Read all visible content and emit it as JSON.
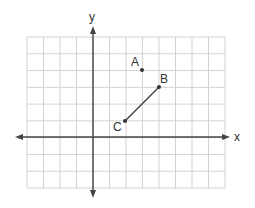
{
  "chart_data": {
    "type": "scatter",
    "title": "",
    "xlabel": "x",
    "ylabel": "y",
    "grid": true,
    "xlim": [
      -4,
      8
    ],
    "ylim": [
      -3,
      6
    ],
    "points": [
      {
        "label": "A",
        "x": 3,
        "y": 4
      },
      {
        "label": "B",
        "x": 4,
        "y": 3
      },
      {
        "label": "C",
        "x": 2,
        "y": 1
      }
    ],
    "segments": [
      {
        "from": "C",
        "to": "B"
      }
    ]
  },
  "axes": {
    "x_label": "x",
    "y_label": "y"
  },
  "labels": {
    "A": "A",
    "B": "B",
    "C": "C"
  },
  "colors": {
    "grid": "#d0d0d0",
    "axis": "#444444",
    "point": "#333333"
  }
}
